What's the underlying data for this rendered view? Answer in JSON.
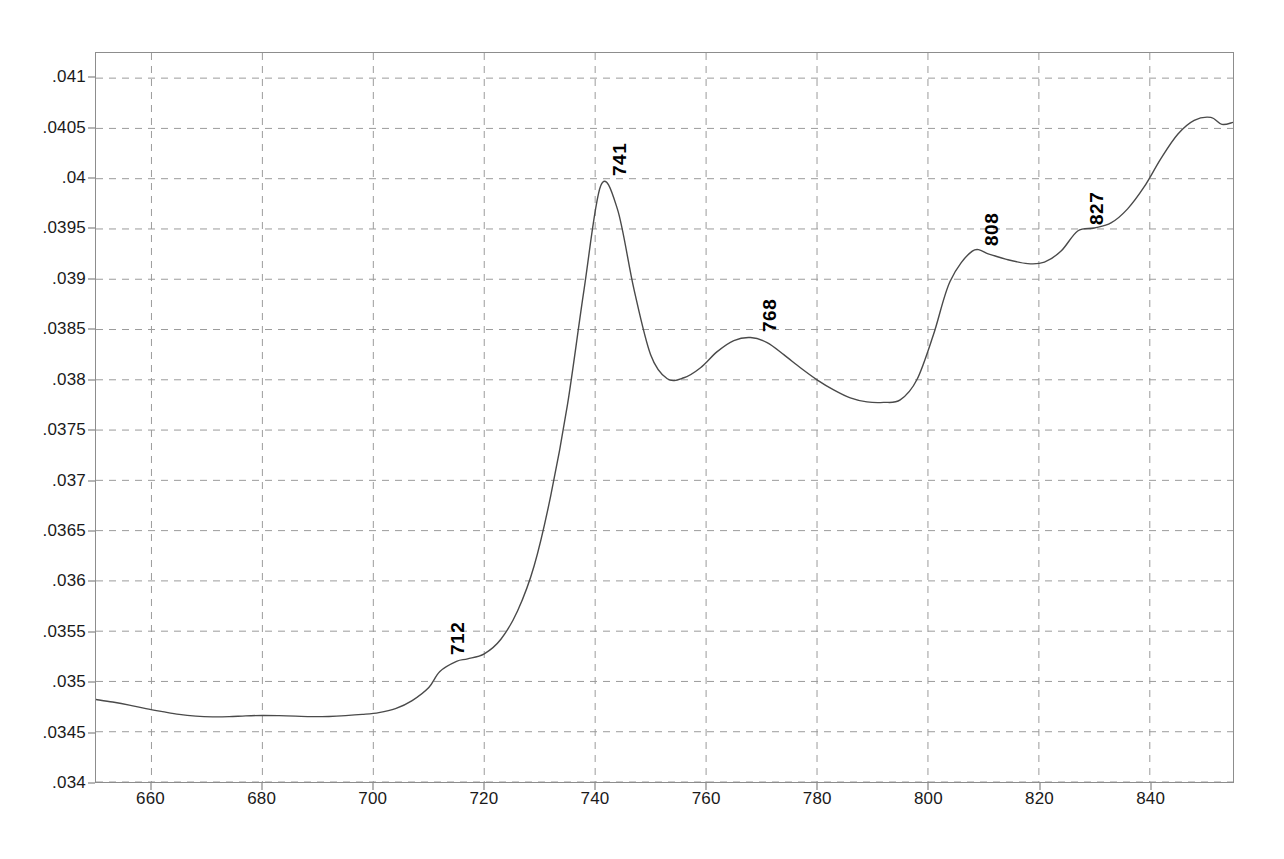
{
  "chart_data": {
    "type": "line",
    "title": "",
    "subtitle": "",
    "xlabel": "",
    "ylabel": "",
    "xlim": [
      650,
      855
    ],
    "ylim": [
      0.034,
      0.04125
    ],
    "grid": true,
    "legend": null,
    "x_ticks": [
      660,
      680,
      700,
      720,
      740,
      760,
      780,
      800,
      820,
      840
    ],
    "x_tick_labels": [
      "660",
      "680",
      "700",
      "720",
      "740",
      "760",
      "780",
      "800",
      "820",
      "840"
    ],
    "y_ticks": [
      0.034,
      0.0345,
      0.035,
      0.0355,
      0.036,
      0.0365,
      0.037,
      0.0375,
      0.038,
      0.0385,
      0.039,
      0.0395,
      0.04,
      0.0405,
      0.041
    ],
    "y_tick_labels": [
      ".034",
      ".0345",
      ".035",
      ".0355",
      ".036",
      ".0365",
      ".037",
      ".0375",
      ".038",
      ".0385",
      ".039",
      ".0395",
      ".04",
      ".0405",
      ".041"
    ],
    "line_color": "#4a4a4a",
    "grid_color": "#9b9b9b",
    "axis_color": "#8d8d8d",
    "annotations": [
      {
        "label": "712",
        "x": 712,
        "y": 0.03522,
        "rotation": -90
      },
      {
        "label": "741",
        "x": 741,
        "y": 0.03997,
        "rotation": -90
      },
      {
        "label": "768",
        "x": 768,
        "y": 0.03842,
        "rotation": -90
      },
      {
        "label": "808",
        "x": 808,
        "y": 0.03928,
        "rotation": -90
      },
      {
        "label": "827",
        "x": 827,
        "y": 0.03948,
        "rotation": -90
      }
    ],
    "series": [
      {
        "name": "spectrum",
        "x": [
          650,
          653,
          656,
          659,
          662,
          665,
          668,
          671,
          674,
          677,
          680,
          683,
          686,
          689,
          692,
          695,
          698,
          701,
          704,
          707,
          710,
          712,
          715,
          717,
          720,
          723,
          726,
          729,
          732,
          735,
          738,
          741,
          744,
          747,
          750,
          753,
          756,
          759,
          762,
          765,
          768,
          771,
          774,
          777,
          780,
          783,
          786,
          789,
          792,
          795,
          798,
          801,
          804,
          808,
          811,
          814,
          818,
          821,
          824,
          827,
          830,
          833,
          836,
          839,
          842,
          845,
          848,
          851,
          853,
          855
        ],
        "y": [
          0.03482,
          0.034795,
          0.034765,
          0.03473,
          0.0347,
          0.034672,
          0.034655,
          0.034648,
          0.03465,
          0.034658,
          0.034662,
          0.03466,
          0.034655,
          0.03465,
          0.034652,
          0.03466,
          0.034672,
          0.03469,
          0.03473,
          0.03481,
          0.03494,
          0.0351,
          0.0352,
          0.035225,
          0.035275,
          0.03542,
          0.0357,
          0.03615,
          0.03685,
          0.03775,
          0.0389,
          0.03993,
          0.0397,
          0.0389,
          0.03825,
          0.03801,
          0.03802,
          0.03812,
          0.03828,
          0.03839,
          0.03842,
          0.03837,
          0.03825,
          0.03812,
          0.038,
          0.0379,
          0.03782,
          0.03778,
          0.037775,
          0.0378,
          0.038,
          0.03845,
          0.03898,
          0.03928,
          0.03925,
          0.0392,
          0.039155,
          0.03917,
          0.03928,
          0.03948,
          0.03951,
          0.03956,
          0.0397,
          0.03992,
          0.0402,
          0.04044,
          0.04058,
          0.04061,
          0.04054,
          0.04056
        ]
      }
    ]
  },
  "axes": {
    "y_labels": [
      ".041",
      ".0405",
      ".04",
      ".0395",
      ".039",
      ".0385",
      ".038",
      ".0375",
      ".037",
      ".0365",
      ".036",
      ".0355",
      ".035",
      ".0345",
      ".034"
    ],
    "x_labels": [
      "660",
      "680",
      "700",
      "720",
      "740",
      "760",
      "780",
      "800",
      "820",
      "840"
    ]
  },
  "peaks": {
    "p712": "712",
    "p741": "741",
    "p768": "768",
    "p808": "808",
    "p827": "827"
  }
}
